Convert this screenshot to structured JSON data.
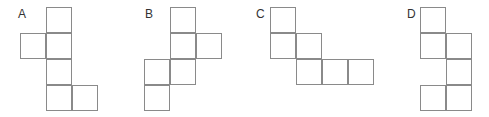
{
  "cell_size": 26,
  "line_color": "#8a8a8a",
  "figures": [
    {
      "label": "A",
      "label_pos": [
        18,
        8
      ],
      "origin": [
        20,
        7
      ],
      "cells": [
        [
          1,
          0
        ],
        [
          0,
          1
        ],
        [
          1,
          1
        ],
        [
          1,
          2
        ],
        [
          1,
          3
        ],
        [
          2,
          3
        ]
      ]
    },
    {
      "label": "B",
      "label_pos": [
        145,
        8
      ],
      "origin": [
        144,
        7
      ],
      "cells": [
        [
          1,
          0
        ],
        [
          1,
          1
        ],
        [
          2,
          1
        ],
        [
          0,
          2
        ],
        [
          1,
          2
        ],
        [
          0,
          3
        ]
      ]
    },
    {
      "label": "C",
      "label_pos": [
        256,
        8
      ],
      "origin": [
        270,
        7
      ],
      "cells": [
        [
          0,
          0
        ],
        [
          0,
          1
        ],
        [
          1,
          1
        ],
        [
          1,
          2
        ],
        [
          2,
          2
        ],
        [
          3,
          2
        ]
      ]
    },
    {
      "label": "D",
      "label_pos": [
        407,
        8
      ],
      "origin": [
        420,
        7
      ],
      "cells": [
        [
          0,
          0
        ],
        [
          0,
          1
        ],
        [
          1,
          1
        ],
        [
          1,
          2
        ],
        [
          0,
          3
        ],
        [
          1,
          3
        ]
      ]
    }
  ]
}
